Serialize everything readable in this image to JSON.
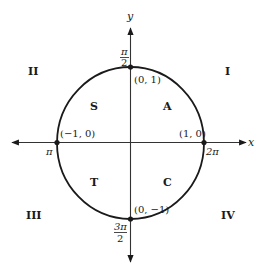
{
  "diagram": {
    "type": "unit-circle",
    "axes": {
      "x_label": "x",
      "y_label": "y"
    },
    "quadrants": {
      "q1": "I",
      "q2": "II",
      "q3": "III",
      "q4": "IV"
    },
    "astc": {
      "q1": "A",
      "q2": "S",
      "q3": "T",
      "q4": "C"
    },
    "points": {
      "top": "(0, 1)",
      "left": "(−1, 0)",
      "right": "(1, 0)",
      "bottom": "(0, −1)"
    },
    "angles": {
      "top_num": "π",
      "top_den": "2",
      "left": "π",
      "right": "2π",
      "bottom_num": "3π",
      "bottom_den": "2"
    },
    "colors": {
      "stroke": "#1a1a1a",
      "axis": "#333333",
      "background": "#ffffff"
    }
  }
}
